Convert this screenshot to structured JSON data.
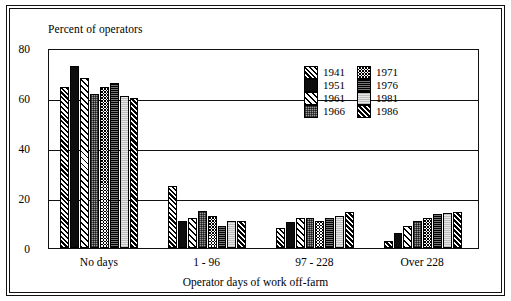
{
  "chart_data": {
    "type": "bar",
    "title": "",
    "ylabel": "Percent of operators",
    "xlabel": "Operator days of work off-farm",
    "ylim": [
      0,
      80
    ],
    "yticks": [
      0,
      20,
      40,
      60,
      80
    ],
    "grid": true,
    "legend_position": "inside-top-right",
    "categories": [
      "No days",
      "1 - 96",
      "97 - 228",
      "Over 228"
    ],
    "series": [
      {
        "name": "1941",
        "pattern": "diagonal-hatch-dark",
        "values": [
          64.5,
          25.0,
          8.0,
          3.0
        ]
      },
      {
        "name": "1951",
        "pattern": "solid-black",
        "values": [
          73.0,
          11.0,
          10.5,
          6.0
        ]
      },
      {
        "name": "1961",
        "pattern": "diagonal-hatch-light",
        "values": [
          68.0,
          12.0,
          12.0,
          9.0
        ]
      },
      {
        "name": "1966",
        "pattern": "dotted-gray",
        "values": [
          61.5,
          15.0,
          12.0,
          11.0
        ]
      },
      {
        "name": "1971",
        "pattern": "checkerboard",
        "values": [
          64.5,
          13.0,
          11.0,
          12.0
        ]
      },
      {
        "name": "1976",
        "pattern": "dense-dark",
        "values": [
          66.0,
          9.0,
          12.0,
          13.5
        ]
      },
      {
        "name": "1981",
        "pattern": "light-gray",
        "values": [
          61.0,
          11.0,
          13.0,
          14.0
        ]
      },
      {
        "name": "1986",
        "pattern": "diagonal-hatch-black",
        "values": [
          60.0,
          11.0,
          14.5,
          14.5
        ]
      }
    ]
  }
}
